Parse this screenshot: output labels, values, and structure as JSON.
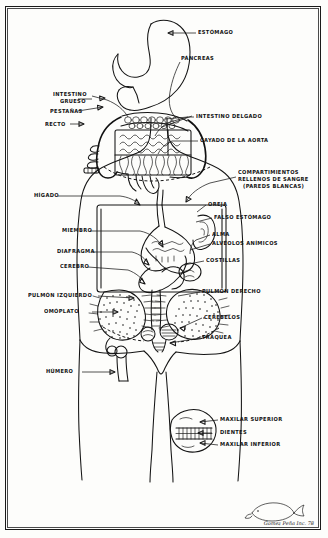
{
  "artwork": {
    "title": "Diagrama anatómico dibujado a mano",
    "medium": "ink-drawing",
    "frame_color": "#141414",
    "paper_color": "#fdfdfb",
    "ink_color": "#141414"
  },
  "labels": {
    "estomago": "ESTÓMAGO",
    "pancreas": "PÁNCREAS",
    "intestino_grueso_l1": "INTESTINO",
    "intestino_grueso_l2": "GRUESO",
    "pestanas": "PESTAÑAS",
    "recto": "RECTO",
    "intestino_delgado": "INTESTINO  DELGADO",
    "cayado_aorta": "CAYADO DE LA AORTA",
    "compartimientos_l1": "COMPARTIMIENTOS",
    "compartimientos_l2": "RELLENOS DE SANGRE",
    "compartimientos_l3": "(PAREDS BLANCAS)",
    "higado": "HÍGADO",
    "oreja": "OREJA",
    "falso_estomago": "FALSO ESTÓMAGO",
    "miembro": "MIEMBRO",
    "alma": "ALMA",
    "alveolos_animicos": "ALVÉOLOS ANÍMICOS",
    "diafragma": "DIAFRAGMA",
    "costillas": "COSTILLAS",
    "cerebro": "CEREBRO",
    "pulmon_izquierdo": "PULMÓN IZQUIERDO",
    "pulmon_derecho": "PULMÓN DERECHO",
    "omoplato": "OMÓPLATO",
    "cerebelos": "CEREBELOS",
    "traquea": "TRÁQUEA",
    "humero": "HÚMERO",
    "maxilar_superior": "MAXILAR SUPERIOR",
    "dientes": "DIENTES",
    "maxilar_inferior": "MAXILAR INFERIOR"
  },
  "signature": {
    "text": "Gomez Peña Inc. 78",
    "mark": "whale-doodle"
  }
}
